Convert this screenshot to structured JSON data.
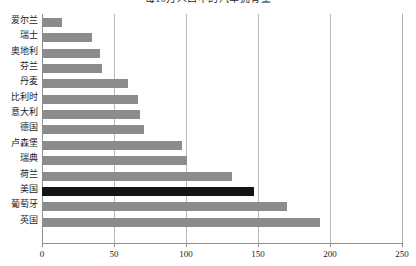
{
  "chart_data": {
    "type": "bar",
    "orientation": "horizontal",
    "title": "每10万人口中的汽车拥有量",
    "xlabel": "",
    "ylabel": "",
    "xlim": [
      0,
      250
    ],
    "xticks": [
      0,
      50,
      100,
      150,
      200,
      250
    ],
    "xtick_labels": [
      "0",
      "50",
      "100",
      "150",
      "200",
      "250"
    ],
    "grid": "vertical",
    "legend": "none",
    "categories": [
      "爱尔兰",
      "瑞士",
      "奥地利",
      "芬兰",
      "丹麦",
      "比利时",
      "意大利",
      "德国",
      "卢森堡",
      "瑞典",
      "荷兰",
      "美国",
      "葡萄牙",
      "英国"
    ],
    "values": [
      14,
      35,
      40,
      42,
      60,
      67,
      68,
      71,
      97,
      101,
      132,
      147,
      170,
      193
    ],
    "bars": [
      {
        "label": "爱尔兰",
        "value": 14,
        "color": "#8c8c8c",
        "highlight": false
      },
      {
        "label": "瑞士",
        "value": 35,
        "color": "#8c8c8c",
        "highlight": false
      },
      {
        "label": "奥地利",
        "value": 40,
        "color": "#8c8c8c",
        "highlight": false
      },
      {
        "label": "芬兰",
        "value": 42,
        "color": "#8c8c8c",
        "highlight": false
      },
      {
        "label": "丹麦",
        "value": 60,
        "color": "#8c8c8c",
        "highlight": false
      },
      {
        "label": "比利时",
        "value": 67,
        "color": "#8c8c8c",
        "highlight": false
      },
      {
        "label": "意大利",
        "value": 68,
        "color": "#8c8c8c",
        "highlight": false
      },
      {
        "label": "德国",
        "value": 71,
        "color": "#8c8c8c",
        "highlight": false
      },
      {
        "label": "卢森堡",
        "value": 97,
        "color": "#8c8c8c",
        "highlight": false
      },
      {
        "label": "瑞典",
        "value": 101,
        "color": "#8c8c8c",
        "highlight": false
      },
      {
        "label": "荷兰",
        "value": 132,
        "color": "#8c8c8c",
        "highlight": false
      },
      {
        "label": "美国",
        "value": 147,
        "color": "#141414",
        "highlight": true
      },
      {
        "label": "葡萄牙",
        "value": 170,
        "color": "#8c8c8c",
        "highlight": false
      },
      {
        "label": "英国",
        "value": 193,
        "color": "#8c8c8c",
        "highlight": false
      }
    ],
    "colors": {
      "bar": "#8c8c8c",
      "bar_highlight": "#141414",
      "gridline": "#b9b9b9",
      "axis": "#8f8f8f",
      "text": "#1d1d1d",
      "background": "#ffffff"
    }
  }
}
